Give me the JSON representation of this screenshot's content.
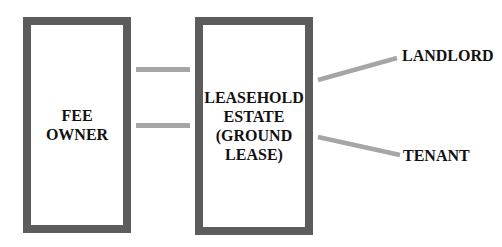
{
  "diagram": {
    "boxes": {
      "fee_owner": {
        "label": "FEE OWNER"
      },
      "leasehold": {
        "label": "LEASEHOLD\nESTATE\n(GROUND\nLEASE)"
      }
    },
    "labels": {
      "landlord": "LANDLORD",
      "tenant": "TENANT"
    },
    "colors": {
      "box_border": "#5c5c5c",
      "connector": "#a6a6a6",
      "text": "#111111"
    }
  }
}
